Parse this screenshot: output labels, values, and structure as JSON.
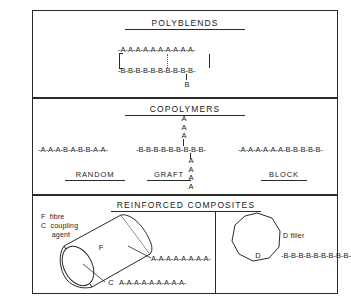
{
  "figure": {
    "sections": [
      {
        "id": "polyblends",
        "title": "POLYBLENDS",
        "chain_a": "-A-A-A-A-A-A-A-A-A-A-",
        "chain_b": "-B-B-B-B-B-B-B-B-B-B-",
        "pendant_b": "B"
      },
      {
        "id": "copolymers",
        "title": "COPOLYMERS",
        "variants": [
          {
            "label": "RANDOM",
            "chain": "-A-A-A-B-A-B-B-A-A-"
          },
          {
            "label": "GRAFT",
            "backbone": "-B-B-B-B-B-B-B-B-B-",
            "branch_up": "A\nA\nA",
            "branch_down": "A\nA\nA\nA"
          },
          {
            "label": "BLOCK",
            "chain": "-A-A-A-A-A-A-B-B-B-B-B-"
          }
        ]
      },
      {
        "id": "composites",
        "title": "REINFORCED COMPOSITES",
        "legend": "F  fibre\nC  coupling\n     agent",
        "fibre_label": "F",
        "fibre_chain_top": "A-A-A-A-A-A-A-A-",
        "fibre_coupling_label": "C",
        "fibre_chain_bottom": "A-A-A-A-A-A-A-A-A-",
        "filler_label": "D",
        "filler_caption": "D filler",
        "filler_chain": "-B-B-B-B-B-B-B-B-B-"
      }
    ]
  },
  "colors": {
    "ink": "#2a2a2a",
    "paper": "#ffffff",
    "dotted": "#555555"
  }
}
